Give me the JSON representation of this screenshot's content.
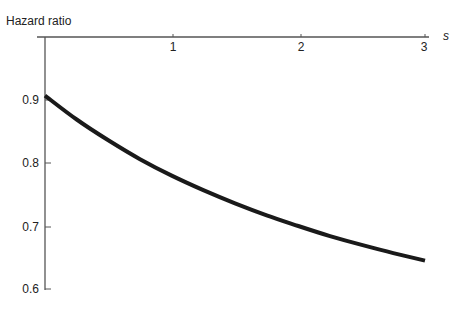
{
  "chart_data": {
    "type": "line",
    "title": "",
    "xlabel": "s",
    "ylabel": "Hazard ratio",
    "xlim": [
      0,
      3
    ],
    "ylim": [
      0.6,
      0.91
    ],
    "x_ticks": [
      "1",
      "2",
      "3"
    ],
    "y_ticks": [
      "0.9",
      "0.8",
      "0.7",
      "0.6"
    ],
    "grid": false,
    "legend": null,
    "series": [
      {
        "name": "Hazard ratio",
        "x": [
          0,
          0.25,
          0.5,
          0.75,
          1.0,
          1.25,
          1.5,
          1.75,
          2.0,
          2.25,
          2.5,
          2.75,
          3.0
        ],
        "y": [
          0.907,
          0.869,
          0.836,
          0.806,
          0.78,
          0.757,
          0.736,
          0.717,
          0.7,
          0.684,
          0.67,
          0.657,
          0.645
        ]
      }
    ]
  }
}
